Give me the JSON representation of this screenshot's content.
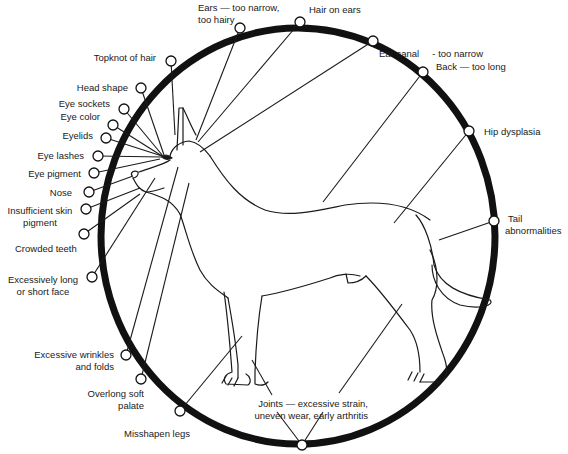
{
  "diagram": {
    "ring_color": "#111111",
    "line_color": "#1a1a1a",
    "labels": [
      {
        "id": "ears",
        "lines": [
          "Ears — too narrow,",
          "too hairy"
        ]
      },
      {
        "id": "hair-on-ears",
        "lines": [
          "Hair on ears"
        ]
      },
      {
        "id": "ear-canal",
        "lines": [
          "Ear canal     - too narrow"
        ]
      },
      {
        "id": "topknot",
        "lines": [
          "Topknot of hair"
        ]
      },
      {
        "id": "back",
        "lines": [
          "Back — too long"
        ]
      },
      {
        "id": "head-shape",
        "lines": [
          "Head shape"
        ]
      },
      {
        "id": "eye-sockets",
        "lines": [
          "Eye sockets"
        ]
      },
      {
        "id": "eye-color",
        "lines": [
          "Eye color"
        ]
      },
      {
        "id": "eyelids",
        "lines": [
          "Eyelids"
        ]
      },
      {
        "id": "hip",
        "lines": [
          "Hip dysplasia"
        ]
      },
      {
        "id": "eye-lashes",
        "lines": [
          "Eye lashes"
        ]
      },
      {
        "id": "eye-pigment",
        "lines": [
          "Eye pigment"
        ]
      },
      {
        "id": "nose",
        "lines": [
          "Nose"
        ]
      },
      {
        "id": "skin-pigment",
        "lines": [
          "Insufficient skin",
          "pigment"
        ]
      },
      {
        "id": "tail",
        "lines": [
          "Tail",
          "abnormalities"
        ]
      },
      {
        "id": "teeth",
        "lines": [
          "Crowded teeth"
        ]
      },
      {
        "id": "face",
        "lines": [
          "Excessively long",
          "or short face"
        ]
      },
      {
        "id": "wrinkles",
        "lines": [
          "Excessive wrinkles",
          "and folds"
        ]
      },
      {
        "id": "palate",
        "lines": [
          "Overlong soft",
          "palate"
        ]
      },
      {
        "id": "joints",
        "lines": [
          "Joints — excessive strain,",
          "uneven wear, early arthritis"
        ]
      },
      {
        "id": "legs",
        "lines": [
          "Misshapen legs"
        ]
      }
    ]
  }
}
